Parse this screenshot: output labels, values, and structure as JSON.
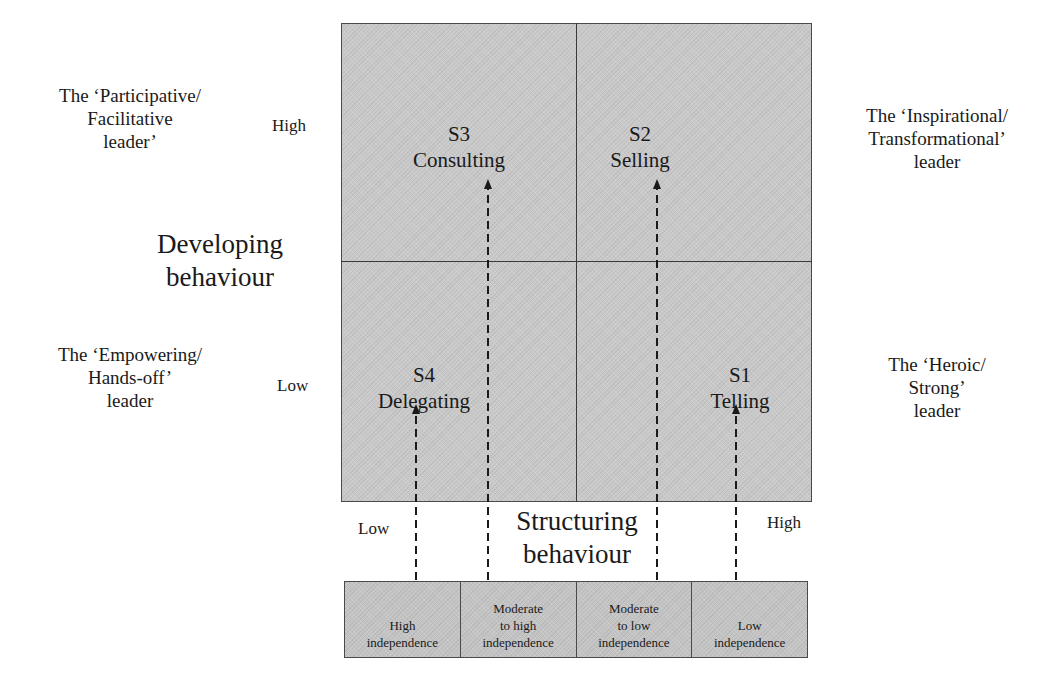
{
  "quadrants": {
    "s3": {
      "code": "S3",
      "name": "Consulting"
    },
    "s2": {
      "code": "S2",
      "name": "Selling"
    },
    "s4": {
      "code": "S4",
      "name": "Delegating"
    },
    "s1": {
      "code": "S1",
      "name": "Telling"
    }
  },
  "leader_types": {
    "top_left": [
      "The ‘Participative/",
      "Facilitative",
      "leader’"
    ],
    "top_right": [
      "The ‘Inspirational/",
      "Transformational’",
      "leader"
    ],
    "bottom_left": [
      "The ‘Empowering/",
      "Hands-off’",
      "leader"
    ],
    "bottom_right": [
      "The ‘Heroic/",
      "Strong’",
      "leader"
    ]
  },
  "y_axis": {
    "title": [
      "Developing",
      "behaviour"
    ],
    "high": "High",
    "low": "Low"
  },
  "x_axis": {
    "title": [
      "Structuring",
      "behaviour"
    ],
    "low": "Low",
    "high": "High"
  },
  "independence_levels": [
    {
      "lines": [
        "High",
        "independence"
      ],
      "targets": "S4"
    },
    {
      "lines": [
        "Moderate",
        "to high",
        "independence"
      ],
      "targets": "S3"
    },
    {
      "lines": [
        "Moderate",
        "to low",
        "independence"
      ],
      "targets": "S2"
    },
    {
      "lines": [
        "Low",
        "independence"
      ],
      "targets": "S1"
    }
  ],
  "colors": {
    "fill": "#c9c9c9",
    "line": "#3a3a3a",
    "text": "#1a1a1a"
  }
}
